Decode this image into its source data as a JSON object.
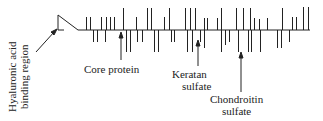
{
  "diagram": {
    "colors": {
      "stroke": "#222222",
      "text": "#222222",
      "background": "#ffffff"
    },
    "labels": {
      "hyaluronic_line1": "Hyaluronic acid",
      "hyaluronic_line2": "binding region",
      "core_protein": "Core protein",
      "keratan_line1": "Keratan",
      "keratan_line2": "sulfate",
      "chondroitin_line1": "Chondroitin",
      "chondroitin_line2": "sulfate"
    },
    "backbone": {
      "x1": 78,
      "x2": 310,
      "y": 30
    },
    "ticks_up": [
      [
        86,
        17
      ],
      [
        90,
        17
      ],
      [
        101,
        17
      ],
      [
        106,
        17
      ],
      [
        110,
        17
      ],
      [
        114,
        17
      ],
      [
        123,
        8
      ],
      [
        136,
        17
      ],
      [
        147,
        8
      ],
      [
        151,
        8
      ],
      [
        164,
        17
      ],
      [
        169,
        8
      ],
      [
        185,
        8
      ],
      [
        190,
        8
      ],
      [
        195,
        8
      ],
      [
        204,
        18
      ],
      [
        207,
        18
      ],
      [
        217,
        18
      ],
      [
        221,
        8
      ],
      [
        236,
        8
      ],
      [
        243,
        8
      ],
      [
        250,
        8
      ],
      [
        254,
        18
      ],
      [
        259,
        19
      ],
      [
        267,
        18
      ],
      [
        282,
        8
      ],
      [
        292,
        17
      ],
      [
        296,
        17
      ],
      [
        303,
        7
      ],
      [
        308,
        7
      ]
    ],
    "ticks_down": [
      [
        93,
        42
      ],
      [
        97,
        42
      ],
      [
        105,
        42
      ],
      [
        126,
        52
      ],
      [
        130,
        52
      ],
      [
        137,
        42
      ],
      [
        142,
        42
      ],
      [
        154,
        52
      ],
      [
        158,
        52
      ],
      [
        171,
        42
      ],
      [
        174,
        42
      ],
      [
        187,
        52
      ],
      [
        192,
        52
      ],
      [
        200,
        42
      ],
      [
        204,
        48
      ],
      [
        221,
        52
      ],
      [
        225,
        45
      ],
      [
        229,
        42
      ],
      [
        238,
        52
      ],
      [
        248,
        52
      ],
      [
        251,
        52
      ],
      [
        260,
        52
      ],
      [
        277,
        48
      ],
      [
        281,
        48
      ],
      [
        289,
        42
      ]
    ]
  }
}
